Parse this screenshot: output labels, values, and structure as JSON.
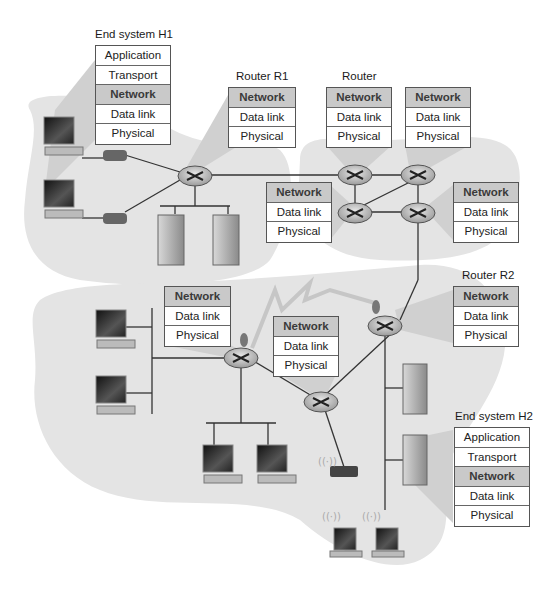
{
  "figure": {
    "type": "network-layer-diagram",
    "colors": {
      "cloud": "#e4e4e4",
      "cloud_shade": "#d2d2d2",
      "network_cell": "#c9c9c9",
      "cell_bg": "#ffffff",
      "line": "#333333"
    }
  },
  "end_system_h1": {
    "title": "End system H1",
    "layers": [
      "Application",
      "Transport",
      "Network",
      "Data link",
      "Physical"
    ]
  },
  "router_r1": {
    "title": "Router R1",
    "layers": [
      "Network",
      "Data link",
      "Physical"
    ]
  },
  "router_top": {
    "title": "Router",
    "layers": [
      "Network",
      "Data link",
      "Physical"
    ]
  },
  "router_top_right": {
    "layers": [
      "Network",
      "Data link",
      "Physical"
    ]
  },
  "router_mid_left": {
    "layers": [
      "Network",
      "Data link",
      "Physical"
    ]
  },
  "router_mid_right": {
    "layers": [
      "Network",
      "Data link",
      "Physical"
    ]
  },
  "router_r2": {
    "title": "Router R2",
    "layers": [
      "Network",
      "Data link",
      "Physical"
    ]
  },
  "router_lower_left": {
    "layers": [
      "Network",
      "Data link",
      "Physical"
    ]
  },
  "router_lower_center": {
    "layers": [
      "Network",
      "Data link",
      "Physical"
    ]
  },
  "end_system_h2": {
    "title": "End system H2",
    "layers": [
      "Application",
      "Transport",
      "Network",
      "Data link",
      "Physical"
    ]
  },
  "icons": [
    "desktop-computer-icon",
    "modem-icon",
    "router-icon",
    "server-tower-icon",
    "wireless-access-point-icon",
    "laptop-icon",
    "satellite-dish-icon",
    "wireless-link-icon"
  ]
}
